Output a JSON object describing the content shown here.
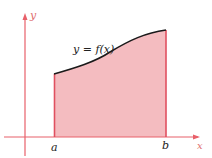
{
  "labels": {
    "y_axis": "y",
    "x_axis": "x",
    "function": "y = f(x)",
    "a": "a",
    "b": "b"
  },
  "colors": {
    "axis": "#e8606a",
    "fill": "#f4b8bc",
    "curve": "#1a1a1a",
    "bounds": "#e05060"
  }
}
